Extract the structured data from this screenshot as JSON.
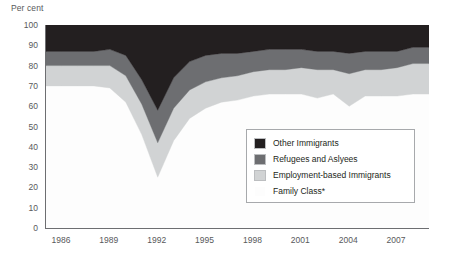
{
  "chart_data": {
    "type": "area",
    "stacked": true,
    "title": "",
    "ylabel": "Per cent",
    "xlabel": "",
    "ylim": [
      0,
      100
    ],
    "yticks": [
      0,
      10,
      20,
      30,
      40,
      50,
      60,
      70,
      80,
      90,
      100
    ],
    "xlim": [
      1985,
      2009
    ],
    "xticks": [
      1986,
      1989,
      1992,
      1995,
      1998,
      2001,
      2004,
      2007
    ],
    "grid": false,
    "legend_position": "lower-right-inside",
    "x": [
      1985,
      1986,
      1987,
      1988,
      1989,
      1990,
      1991,
      1992,
      1993,
      1994,
      1995,
      1996,
      1997,
      1998,
      1999,
      2000,
      2001,
      2002,
      2003,
      2004,
      2005,
      2006,
      2007,
      2008,
      2009
    ],
    "series": [
      {
        "name": "Family Class*",
        "color": "#fdfdfd",
        "values": [
          70,
          70,
          70,
          70,
          69,
          62,
          46,
          25,
          43,
          54,
          59,
          62,
          63,
          65,
          66,
          66,
          66,
          64,
          66,
          60,
          65,
          65,
          65,
          66,
          66
        ]
      },
      {
        "name": "Employment-based Immigrants",
        "color": "#d1d3d4",
        "values": [
          10,
          10,
          10,
          10,
          11,
          13,
          15,
          17,
          16,
          14,
          13,
          12,
          12,
          12,
          12,
          12,
          13,
          14,
          12,
          16,
          13,
          13,
          14,
          15,
          15
        ]
      },
      {
        "name": "Refugees and Aslyees",
        "color": "#6d6e71",
        "values": [
          7,
          7,
          7,
          7,
          8,
          10,
          12,
          16,
          15,
          14,
          13,
          12,
          11,
          10,
          10,
          10,
          9,
          9,
          9,
          10,
          9,
          9,
          8,
          8,
          8
        ]
      },
      {
        "name": "Other Immigrants",
        "color": "#231f20",
        "values": [
          13,
          13,
          13,
          13,
          12,
          15,
          27,
          42,
          26,
          18,
          15,
          14,
          14,
          13,
          12,
          12,
          12,
          13,
          13,
          14,
          13,
          13,
          13,
          11,
          11
        ]
      }
    ]
  },
  "axis": {
    "ylabel": "Per cent",
    "yticks": [
      "100",
      "90",
      "80",
      "70",
      "60",
      "50",
      "40",
      "30",
      "20",
      "10",
      "0"
    ],
    "xticks": [
      "1986",
      "1989",
      "1992",
      "1995",
      "1998",
      "2001",
      "2004",
      "2007"
    ]
  },
  "legend": {
    "items": [
      {
        "label": "Other Immigrants",
        "color": "#231f20"
      },
      {
        "label": "Refugees and Aslyees",
        "color": "#6d6e71"
      },
      {
        "label": "Employment-based Immigrants",
        "color": "#d1d3d4"
      },
      {
        "label": "Family Class*",
        "color": "#fdfdfd"
      }
    ]
  },
  "colors": {
    "axis": "#6d6e71",
    "text": "#58595b",
    "legend_border": "#a7a9ac",
    "background": "#ffffff"
  }
}
